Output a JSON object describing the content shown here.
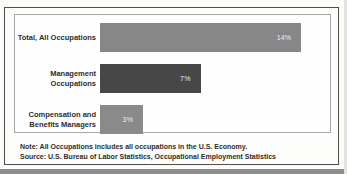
{
  "chart_data": {
    "type": "bar",
    "orientation": "horizontal",
    "title": "",
    "categories": [
      "Total, All Occupations",
      "Management Occupations",
      "Compensation and Benefits Managers"
    ],
    "values": [
      14,
      7,
      3
    ],
    "value_labels": [
      "14%",
      "7%",
      "3%"
    ],
    "xlim": [
      0,
      16
    ],
    "grid": false,
    "legend": "none",
    "bar_colors": [
      "#878787",
      "#474747",
      "#8a8a8a"
    ],
    "note": "Note: All Occupations includes all occupations in the U.S. Economy.",
    "source": "Source: U.S. Bureau of Labor Statistics, Occupational Employment Statistics"
  }
}
